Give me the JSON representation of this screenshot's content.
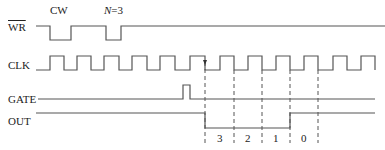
{
  "diagram": {
    "type": "timing-diagram",
    "annotations": {
      "cw": "CW",
      "n_prefix": "N",
      "n_value": "=3"
    },
    "signals": [
      {
        "name": "WR",
        "overline": true
      },
      {
        "name": "CLK",
        "overline": false
      },
      {
        "name": "GATE",
        "overline": false
      },
      {
        "name": "OUT",
        "overline": false
      }
    ],
    "count_labels": [
      "3",
      "2",
      "1",
      "0"
    ],
    "colors": {
      "line": "#555555",
      "text": "#222222"
    }
  }
}
